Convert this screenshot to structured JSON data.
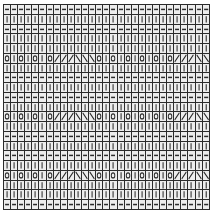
{
  "chart_data": {
    "type": "table",
    "xlabel": "",
    "ylabel": "",
    "columns": 29,
    "rows": 19,
    "grid_on": true,
    "legend_position": "none",
    "symbols": {
      "purl": "—",
      "knit": "|",
      "yarn_over": "O",
      "ssk_left_slant": "/",
      "k2tog_right_slant": "\\"
    },
    "symbol_colors": {
      "ink": "#2b2b2b",
      "cell_fill": "#ededed",
      "grid_line": "#2b2b2b",
      "page": "#ffffff"
    },
    "row_labels": [],
    "column_labels": [],
    "cells": [
      [
        "p",
        "p",
        "p",
        "p",
        "p",
        "p",
        "p",
        "p",
        "p",
        "p",
        "p",
        "p",
        "p",
        "p",
        "p",
        "p",
        "p",
        "p",
        "p",
        "p",
        "p",
        "p",
        "p",
        "p",
        "p",
        "p",
        "p",
        "p",
        "p"
      ],
      [
        "k",
        "k",
        "k",
        "k",
        "k",
        "k",
        "k",
        "k",
        "k",
        "k",
        "k",
        "k",
        "k",
        "k",
        "k",
        "k",
        "k",
        "k",
        "k",
        "k",
        "k",
        "k",
        "k",
        "k",
        "k",
        "k",
        "k",
        "k",
        "k"
      ],
      [
        "p",
        "p",
        "p",
        "p",
        "p",
        "p",
        "p",
        "p",
        "p",
        "p",
        "p",
        "p",
        "p",
        "p",
        "p",
        "p",
        "p",
        "p",
        "p",
        "p",
        "p",
        "p",
        "p",
        "p",
        "p",
        "p",
        "p",
        "p",
        "p"
      ],
      [
        "k",
        "k",
        "k",
        "k",
        "k",
        "k",
        "k",
        "k",
        "k",
        "k",
        "k",
        "k",
        "k",
        "k",
        "k",
        "k",
        "k",
        "k",
        "k",
        "k",
        "k",
        "k",
        "k",
        "k",
        "k",
        "k",
        "k",
        "k",
        "k"
      ],
      [
        "k",
        "k",
        "k",
        "k",
        "k",
        "k",
        "k",
        "k",
        "k",
        "k",
        "k",
        "k",
        "k",
        "k",
        "k",
        "k",
        "k",
        "k",
        "k",
        "k",
        "k",
        "k",
        "k",
        "k",
        "k",
        "k",
        "k",
        "k",
        "k"
      ],
      [
        "o",
        "k",
        "o",
        "k",
        "o",
        "k",
        "o",
        "l",
        "l",
        "l",
        "r",
        "r",
        "r",
        "o",
        "k",
        "o",
        "k",
        "o",
        "k",
        "o",
        "k",
        "o",
        "k",
        "o",
        "l",
        "l",
        "l",
        "r",
        "r"
      ],
      [
        "k",
        "k",
        "k",
        "k",
        "k",
        "k",
        "k",
        "k",
        "k",
        "k",
        "k",
        "k",
        "k",
        "k",
        "k",
        "k",
        "k",
        "k",
        "k",
        "k",
        "k",
        "k",
        "k",
        "k",
        "k",
        "k",
        "k",
        "k",
        "k"
      ],
      [
        "p",
        "p",
        "p",
        "p",
        "p",
        "p",
        "p",
        "p",
        "p",
        "p",
        "p",
        "p",
        "p",
        "p",
        "p",
        "p",
        "p",
        "p",
        "p",
        "p",
        "p",
        "p",
        "p",
        "p",
        "p",
        "p",
        "p",
        "p",
        "p"
      ],
      [
        "k",
        "k",
        "k",
        "k",
        "k",
        "k",
        "k",
        "k",
        "k",
        "k",
        "k",
        "k",
        "k",
        "k",
        "k",
        "k",
        "k",
        "k",
        "k",
        "k",
        "k",
        "k",
        "k",
        "k",
        "k",
        "k",
        "k",
        "k",
        "k"
      ],
      [
        "p",
        "p",
        "p",
        "p",
        "p",
        "p",
        "p",
        "p",
        "p",
        "p",
        "p",
        "p",
        "p",
        "p",
        "p",
        "p",
        "p",
        "p",
        "p",
        "p",
        "p",
        "p",
        "p",
        "p",
        "p",
        "p",
        "p",
        "p",
        "p"
      ],
      [
        "k",
        "k",
        "k",
        "k",
        "k",
        "k",
        "k",
        "k",
        "k",
        "k",
        "k",
        "k",
        "k",
        "k",
        "k",
        "k",
        "k",
        "k",
        "k",
        "k",
        "k",
        "k",
        "k",
        "k",
        "k",
        "k",
        "k",
        "k",
        "k"
      ],
      [
        "o",
        "k",
        "o",
        "k",
        "o",
        "k",
        "o",
        "l",
        "l",
        "l",
        "r",
        "r",
        "r",
        "o",
        "k",
        "o",
        "k",
        "o",
        "k",
        "o",
        "k",
        "o",
        "k",
        "o",
        "l",
        "l",
        "l",
        "r",
        "r"
      ],
      [
        "k",
        "k",
        "k",
        "k",
        "k",
        "k",
        "k",
        "k",
        "k",
        "k",
        "k",
        "k",
        "k",
        "k",
        "k",
        "k",
        "k",
        "k",
        "k",
        "k",
        "k",
        "k",
        "k",
        "k",
        "k",
        "k",
        "k",
        "k",
        "k"
      ],
      [
        "p",
        "p",
        "p",
        "p",
        "p",
        "p",
        "p",
        "p",
        "p",
        "p",
        "p",
        "p",
        "p",
        "p",
        "p",
        "p",
        "p",
        "p",
        "p",
        "p",
        "p",
        "p",
        "p",
        "p",
        "p",
        "p",
        "p",
        "p",
        "p"
      ],
      [
        "k",
        "k",
        "k",
        "k",
        "k",
        "k",
        "k",
        "k",
        "k",
        "k",
        "k",
        "k",
        "k",
        "k",
        "k",
        "k",
        "k",
        "k",
        "k",
        "k",
        "k",
        "k",
        "k",
        "k",
        "k",
        "k",
        "k",
        "k",
        "k"
      ],
      [
        "p",
        "p",
        "p",
        "p",
        "p",
        "p",
        "p",
        "p",
        "p",
        "p",
        "p",
        "p",
        "p",
        "p",
        "p",
        "p",
        "p",
        "p",
        "p",
        "p",
        "p",
        "p",
        "p",
        "p",
        "p",
        "p",
        "p",
        "p",
        "p"
      ],
      [
        "k",
        "k",
        "k",
        "k",
        "k",
        "k",
        "k",
        "k",
        "k",
        "k",
        "k",
        "k",
        "k",
        "k",
        "k",
        "k",
        "k",
        "k",
        "k",
        "k",
        "k",
        "k",
        "k",
        "k",
        "k",
        "k",
        "k",
        "k",
        "k"
      ],
      [
        "o",
        "k",
        "o",
        "k",
        "o",
        "k",
        "o",
        "l",
        "l",
        "l",
        "r",
        "r",
        "r",
        "o",
        "k",
        "o",
        "k",
        "o",
        "k",
        "o",
        "k",
        "o",
        "k",
        "o",
        "l",
        "l",
        "l",
        "r",
        "r"
      ],
      [
        "k",
        "k",
        "k",
        "k",
        "k",
        "k",
        "k",
        "k",
        "k",
        "k",
        "k",
        "k",
        "k",
        "k",
        "k",
        "k",
        "k",
        "k",
        "k",
        "k",
        "k",
        "k",
        "k",
        "k",
        "k",
        "k",
        "k",
        "k",
        "k"
      ],
      [
        "k",
        "k",
        "k",
        "k",
        "k",
        "k",
        "k",
        "k",
        "k",
        "k",
        "k",
        "k",
        "k",
        "k",
        "k",
        "k",
        "k",
        "k",
        "k",
        "k",
        "k",
        "k",
        "k",
        "k",
        "k",
        "k",
        "k",
        "k",
        "k"
      ],
      [
        "p",
        "p",
        "p",
        "p",
        "p",
        "p",
        "p",
        "p",
        "p",
        "p",
        "p",
        "p",
        "p",
        "p",
        "p",
        "p",
        "p",
        "p",
        "p",
        "p",
        "p",
        "p",
        "p",
        "p",
        "p",
        "p",
        "p",
        "p",
        "p"
      ]
    ]
  },
  "caption": {
    "text": ""
  }
}
